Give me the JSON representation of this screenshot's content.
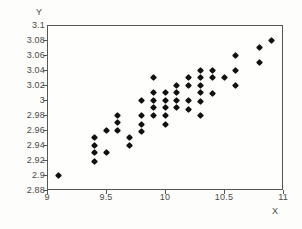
{
  "chart_data": {
    "type": "scatter",
    "title": "",
    "xlabel": "X",
    "ylabel": "Y",
    "xlim": [
      9,
      11
    ],
    "ylim": [
      2.88,
      3.1
    ],
    "grid": false,
    "legend": null,
    "marker": "diamond",
    "marker_color": "#111111",
    "xticks": [
      "9",
      "9.5",
      "10",
      "10.5",
      "11"
    ],
    "xtick_values": [
      9,
      9.5,
      10,
      10.5,
      11
    ],
    "yticks": [
      "3.1",
      "3.08",
      "3.06",
      "3.04",
      "3.02",
      "3",
      "2.98",
      "2.96",
      "2.94",
      "2.92",
      "2.9",
      "2.88"
    ],
    "ytick_values": [
      3.1,
      3.08,
      3.06,
      3.04,
      3.02,
      3.0,
      2.98,
      2.96,
      2.94,
      2.92,
      2.9,
      2.88
    ],
    "x": [
      9.1,
      9.4,
      9.4,
      9.4,
      9.4,
      9.5,
      9.5,
      9.6,
      9.6,
      9.6,
      9.7,
      9.7,
      9.8,
      9.8,
      9.8,
      9.8,
      9.9,
      9.9,
      9.9,
      9.9,
      9.9,
      10.0,
      10.0,
      10.0,
      10.0,
      10.0,
      10.1,
      10.1,
      10.1,
      10.1,
      10.2,
      10.2,
      10.2,
      10.2,
      10.3,
      10.3,
      10.3,
      10.3,
      10.3,
      10.3,
      10.4,
      10.4,
      10.4,
      10.5,
      10.6,
      10.6,
      10.6,
      10.8,
      10.8,
      10.9
    ],
    "y": [
      2.9,
      2.95,
      2.94,
      2.93,
      2.918,
      2.96,
      2.93,
      2.98,
      2.97,
      2.96,
      2.95,
      2.94,
      3.0,
      2.98,
      2.968,
      2.958,
      3.03,
      3.01,
      3.0,
      2.99,
      2.98,
      3.01,
      3.0,
      2.99,
      2.98,
      2.968,
      3.02,
      3.01,
      3.0,
      2.99,
      3.03,
      3.02,
      3.0,
      2.988,
      3.04,
      3.03,
      3.02,
      3.01,
      2.998,
      2.98,
      3.04,
      3.03,
      3.009,
      3.03,
      3.06,
      3.04,
      3.019,
      3.07,
      3.05,
      3.08
    ],
    "n_points": 50
  },
  "axes": {
    "y_title": "Y",
    "x_title": "X"
  }
}
